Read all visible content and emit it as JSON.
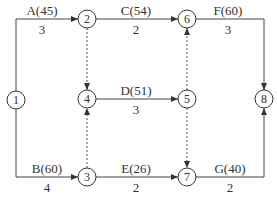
{
  "diagram": {
    "type": "activity-on-arrow network",
    "nodes": [
      {
        "id": "1",
        "label": "1",
        "x": 16,
        "y": 100
      },
      {
        "id": "2",
        "label": "2",
        "x": 87,
        "y": 19
      },
      {
        "id": "3",
        "label": "3",
        "x": 87,
        "y": 177
      },
      {
        "id": "4",
        "label": "4",
        "x": 87,
        "y": 99
      },
      {
        "id": "5",
        "label": "5",
        "x": 187,
        "y": 99
      },
      {
        "id": "6",
        "label": "6",
        "x": 187,
        "y": 19
      },
      {
        "id": "7",
        "label": "7",
        "x": 187,
        "y": 177
      },
      {
        "id": "8",
        "label": "8",
        "x": 264,
        "y": 99
      }
    ],
    "activities": [
      {
        "from": "1",
        "to": "2",
        "name": "A(45)",
        "duration": "3"
      },
      {
        "from": "1",
        "to": "3",
        "name": "B(60)",
        "duration": "4"
      },
      {
        "from": "2",
        "to": "6",
        "name": "C(54)",
        "duration": "2"
      },
      {
        "from": "4",
        "to": "5",
        "name": "D(51)",
        "duration": "3"
      },
      {
        "from": "3",
        "to": "7",
        "name": "E(26)",
        "duration": "2"
      },
      {
        "from": "6",
        "to": "8",
        "name": "F(60)",
        "duration": "3"
      },
      {
        "from": "7",
        "to": "8",
        "name": "G(40)",
        "duration": "2"
      }
    ],
    "dummies": [
      {
        "from": "2",
        "to": "4"
      },
      {
        "from": "3",
        "to": "4"
      },
      {
        "from": "5",
        "to": "6"
      },
      {
        "from": "5",
        "to": "7"
      }
    ]
  }
}
